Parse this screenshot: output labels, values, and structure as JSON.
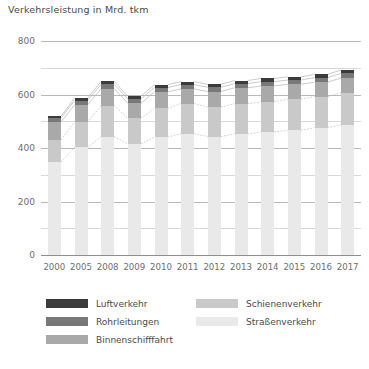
{
  "chart_data": {
    "type": "bar",
    "stacked": true,
    "title": "Verkehrsleistung in Mrd. tkm",
    "xlabel": "",
    "ylabel": "",
    "ylim": [
      0,
      800
    ],
    "yticks": [
      0,
      200,
      400,
      600,
      800
    ],
    "ytick_labels": [
      "0",
      "200",
      "400",
      "600",
      "800"
    ],
    "minor_gridlines": [
      100,
      300,
      500,
      700
    ],
    "grid": true,
    "legend_position": "bottom",
    "categories": [
      "2000",
      "2005",
      "2008",
      "2009",
      "2010",
      "2011",
      "2012",
      "2013",
      "2014",
      "2015",
      "2016",
      "2017"
    ],
    "series": [
      {
        "name": "Straßenverkehr",
        "color": "#e9e9e9",
        "values": [
          347,
          402,
          442,
          415,
          441,
          453,
          443,
          452,
          460,
          466,
          476,
          487
        ]
      },
      {
        "name": "Schienenverkehr",
        "color": "#c9c9c9",
        "values": [
          83,
          95,
          116,
          96,
          107,
          113,
          110,
          113,
          113,
          117,
          116,
          119
        ]
      },
      {
        "name": "Binnenschifffahrt",
        "color": "#a9a9a9",
        "values": [
          66,
          64,
          64,
          56,
          62,
          55,
          58,
          60,
          59,
          55,
          54,
          56
        ]
      },
      {
        "name": "Rohrleitungen",
        "color": "#787878",
        "values": [
          15,
          16,
          16,
          16,
          16,
          16,
          16,
          16,
          16,
          16,
          17,
          17
        ]
      },
      {
        "name": "Luftverkehr",
        "color": "#3b3b3b",
        "values": [
          7,
          9,
          11,
          10,
          11,
          11,
          11,
          11,
          12,
          12,
          12,
          13
        ]
      }
    ],
    "totals": [
      518,
      586,
      649,
      593,
      637,
      648,
      638,
      652,
      660,
      666,
      675,
      692
    ],
    "legend": [
      {
        "label": "Luftverkehr",
        "color": "#3b3b3b"
      },
      {
        "label": "Rohrleitungen",
        "color": "#787878"
      },
      {
        "label": "Binnenschifffahrt",
        "color": "#a9a9a9"
      },
      {
        "label": "Schienenverkehr",
        "color": "#c9c9c9"
      },
      {
        "label": "Straßenverkehr",
        "color": "#e9e9e9"
      }
    ],
    "legend_columns": [
      [
        "Luftverkehr",
        "Rohrleitungen",
        "Binnenschifffahrt"
      ],
      [
        "Schienenverkehr",
        "Straßenverkehr"
      ]
    ]
  },
  "colors": {
    "gridline": "#b9b9b9",
    "gridline_minor": "#d8d8d8",
    "baseline": "#8e8e8e",
    "text": "#4a4a4a",
    "tick_text": "#6d6d6d",
    "connector": "#bdbdbd",
    "background": "#ffffff"
  }
}
